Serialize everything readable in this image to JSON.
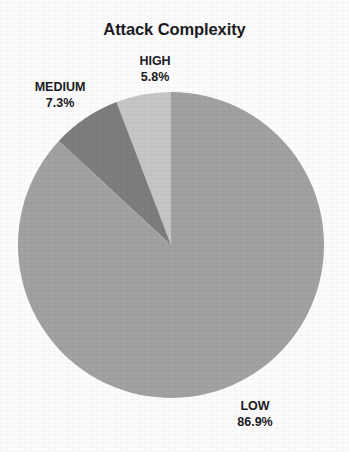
{
  "chart_data": {
    "type": "pie",
    "title": "Attack Complexity",
    "xlabel": "",
    "ylabel": "",
    "grid": false,
    "legend_position": "none",
    "label_format": "name_over_percent",
    "start_angle_deg": 90,
    "direction": "counterclockwise",
    "center": {
      "x": 171,
      "y": 245
    },
    "radius": 153,
    "categories": [
      "HIGH",
      "MEDIUM",
      "LOW"
    ],
    "values": [
      5.8,
      7.3,
      86.9
    ],
    "slices": [
      {
        "name": "HIGH",
        "percent_label": "5.8%",
        "value": 5.8,
        "color": "#c6c6c6",
        "label_x": 155,
        "label_y": 55
      },
      {
        "name": "MEDIUM",
        "percent_label": "7.3%",
        "value": 7.3,
        "color": "#7e7e7e",
        "label_x": 60,
        "label_y": 81
      },
      {
        "name": "LOW",
        "percent_label": "86.9%",
        "value": 86.9,
        "color": "#a2a2a2",
        "label_x": 255,
        "label_y": 400
      }
    ]
  },
  "colors": {
    "background": "#fdfdfd",
    "text": "#1b1b1f",
    "slice_high": "#c6c6c6",
    "slice_medium": "#7e7e7e",
    "slice_low": "#a2a2a2"
  }
}
